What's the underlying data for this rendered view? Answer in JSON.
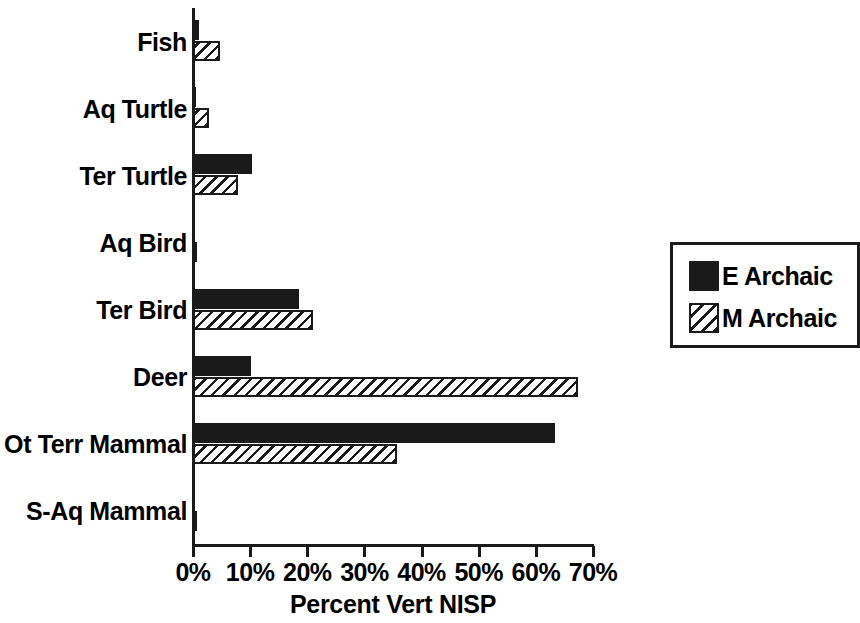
{
  "chart_data": {
    "type": "bar",
    "orientation": "horizontal",
    "title": "",
    "xlabel": "Percent Vert NISP",
    "ylabel": "",
    "xlim": [
      0,
      70
    ],
    "xtick_labels": [
      "0%",
      "10%",
      "20%",
      "30%",
      "40%",
      "50%",
      "60%",
      "70%"
    ],
    "xticks": [
      0,
      10,
      20,
      30,
      40,
      50,
      60,
      70
    ],
    "grid": false,
    "legend_position": "right",
    "categories": [
      "Fish",
      "Aq Turtle",
      "Ter Turtle",
      "Aq Bird",
      "Ter Bird",
      "Deer",
      "Ot Terr Mammal",
      "S-Aq Mammal"
    ],
    "series": [
      {
        "name": "E Archaic",
        "fill": "solid-black",
        "color": "#1a1a1a",
        "values": [
          1.0,
          0.5,
          10.3,
          0.3,
          18.5,
          10.2,
          63.3,
          0.2
        ]
      },
      {
        "name": "M Archaic",
        "fill": "diagonal-hatch",
        "color": "#1a1a1a",
        "values": [
          4.7,
          2.8,
          7.8,
          0.2,
          21.0,
          67.3,
          35.7,
          0.1
        ]
      }
    ]
  },
  "legend": {
    "items": [
      {
        "label": "E Archaic",
        "swatch": "solid"
      },
      {
        "label": "M Archaic",
        "swatch": "hatch"
      }
    ]
  }
}
